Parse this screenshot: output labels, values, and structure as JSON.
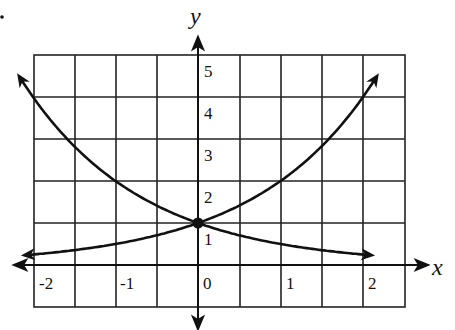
{
  "chart_data": {
    "type": "line",
    "title": "",
    "xlabel": "x",
    "ylabel": "y",
    "xlim": [
      -2.4,
      2.5
    ],
    "ylim": [
      -0.5,
      5.5
    ],
    "grid": true,
    "x_ticks": [
      "-2",
      "-1",
      "0",
      "1",
      "2"
    ],
    "y_ticks": [
      "1",
      "2",
      "3",
      "4",
      "5"
    ],
    "series": [
      {
        "name": "y = 2^x",
        "x": [
          -2.15,
          -2,
          -1,
          0,
          1,
          2,
          2.2
        ],
        "values": [
          0.22,
          0.25,
          0.5,
          1,
          2,
          4,
          4.6
        ]
      },
      {
        "name": "y = (1/2)^x",
        "x": [
          -2.2,
          -2,
          -1,
          0,
          1,
          2,
          2.15
        ],
        "values": [
          4.6,
          4,
          2,
          1,
          0.5,
          0.25,
          0.22
        ]
      }
    ],
    "annotations": [
      {
        "type": "point",
        "x": 0,
        "y": 1,
        "label": "intersection"
      }
    ]
  },
  "labels": {
    "x_axis": "x",
    "y_axis": "y",
    "xt": [
      "-2",
      "-1",
      "0",
      "1",
      "2"
    ],
    "yt": [
      "1",
      "2",
      "3",
      "4",
      "5"
    ]
  }
}
